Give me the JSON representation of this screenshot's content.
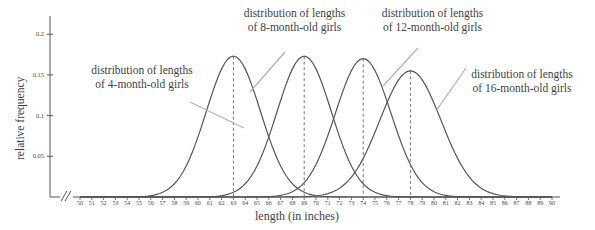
{
  "chart_data": {
    "type": "line",
    "title": "",
    "xlabel": "length (in inches)",
    "ylabel": "relative frequency",
    "xlim": [
      50,
      90
    ],
    "ylim": [
      0,
      0.215
    ],
    "grid": false,
    "axis_break": true,
    "legend_position": "annotations-inline",
    "yticks": [
      "0.05",
      "0.1",
      "0.15",
      "0.2"
    ],
    "ytick_values": [
      0.05,
      0.1,
      0.15,
      0.2
    ],
    "xticks": [
      "50",
      "51",
      "52",
      "53",
      "54",
      "55",
      "56",
      "57",
      "58",
      "59",
      "60",
      "61",
      "62",
      "63",
      "64",
      "65",
      "66",
      "67",
      "68",
      "69",
      "70",
      "71",
      "72",
      "73",
      "74",
      "75",
      "76",
      "77",
      "78",
      "79",
      "80",
      "81",
      "82",
      "83",
      "84",
      "85",
      "86",
      "87",
      "88",
      "89",
      "90"
    ],
    "series": [
      {
        "name": "distribution of lengths of 4-month-old girls",
        "mean": 63,
        "sd": 2.3,
        "peak": 0.173,
        "dashed_line_at": 63
      },
      {
        "name": "distribution of lengths of 8-month-old girls",
        "mean": 69,
        "sd": 2.3,
        "peak": 0.173,
        "dashed_line_at": 69
      },
      {
        "name": "distribution of lengths of 12-month-old girls",
        "mean": 74,
        "sd": 2.35,
        "peak": 0.17,
        "dashed_line_at": 74
      },
      {
        "name": "distribution of lengths of 16-month-old girls",
        "mean": 78,
        "sd": 2.6,
        "peak": 0.155,
        "dashed_line_at": 78
      }
    ],
    "annotations": [
      {
        "line1": "distribution of lengths",
        "line2": "of 4-month-old girls"
      },
      {
        "line1": "distribution of lengths",
        "line2": "of 8-month-old girls"
      },
      {
        "line1": "distribution of lengths",
        "line2": "of 12-month-old girls"
      },
      {
        "line1": "distribution of lengths",
        "line2": "of 16-month-old girls"
      }
    ],
    "colors": {
      "curve": "#555555",
      "axis": "#555555",
      "dashed": "#777777",
      "leader": "#b4b4b4",
      "text": "#3f3f3f"
    }
  }
}
